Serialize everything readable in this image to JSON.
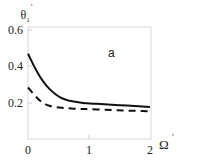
{
  "chart_data": {
    "type": "line",
    "title": "",
    "annotation": "a",
    "xlabel": "Ω'",
    "ylabel": "θ'₁",
    "xlim": [
      0,
      2
    ],
    "ylim": [
      0,
      0.6
    ],
    "x_ticks": [
      "0",
      "1",
      "2"
    ],
    "y_ticks": [
      "0.2",
      "0.4",
      "0.6"
    ],
    "grid": false,
    "legend": null,
    "x": [
      0,
      0.1,
      0.2,
      0.3,
      0.4,
      0.5,
      0.6,
      0.7,
      0.8,
      0.9,
      1.0,
      1.25,
      1.5,
      1.75,
      2.0
    ],
    "series": [
      {
        "name": "solid",
        "style": "solid",
        "color": "#111111",
        "values": [
          0.47,
          0.4,
          0.34,
          0.295,
          0.26,
          0.235,
          0.22,
          0.21,
          0.205,
          0.2,
          0.198,
          0.193,
          0.188,
          0.183,
          0.178
        ]
      },
      {
        "name": "dashed",
        "style": "dashed",
        "color": "#111111",
        "values": [
          0.285,
          0.245,
          0.21,
          0.19,
          0.18,
          0.175,
          0.172,
          0.17,
          0.168,
          0.167,
          0.166,
          0.163,
          0.16,
          0.157,
          0.155
        ]
      }
    ]
  },
  "labels": {
    "y_axis_main": "θ",
    "y_axis_sub": "1",
    "y_axis_sup": "'",
    "x_axis_main": "Ω",
    "x_axis_sup": "'",
    "annotation": "a",
    "ytick_06": "0.6",
    "ytick_04": "0.4",
    "ytick_02": "0.2",
    "xtick_0": "0",
    "xtick_1": "1",
    "xtick_2": "2"
  }
}
